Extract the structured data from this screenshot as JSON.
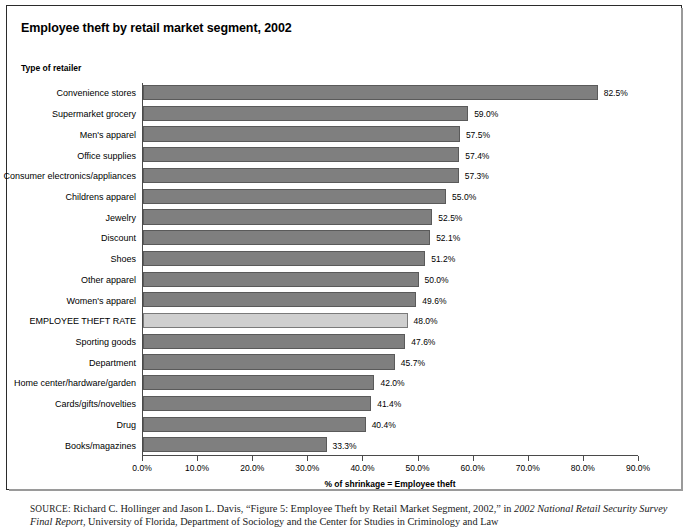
{
  "figure": {
    "title": "Employee theft by retail market segment, 2002",
    "category_axis_title": "Type of retailer",
    "value_axis_title": "% of shrinkage = Employee theft"
  },
  "source": {
    "kicker": "SOURCE:",
    "line1_a": " Richard C. Hollinger and Jason L. Davis, “Figure 5: Employee Theft by Retail Market Segment, 2002,” in ",
    "line1_italic": "2002 National Retail Security Survey",
    "line2_italic": "Final Report",
    "line2_b": ", University of Florida, Department of Sociology and the Center for Studies in Criminology and Law"
  },
  "colors": {
    "bar_fill": "#7f7f7f",
    "bar_stroke": "#5a5a5a",
    "highlight_fill": "#cfcfcf",
    "highlight_stroke": "#7a7a7a",
    "axis": "#4a4a4a",
    "frame": "#2b2b2b"
  },
  "chart_data": {
    "type": "bar",
    "orientation": "horizontal",
    "title": "Employee theft by retail market segment, 2002",
    "xlabel": "% of shrinkage = Employee theft",
    "ylabel": "Type of retailer",
    "xlim": [
      0,
      90
    ],
    "xticks": [
      0,
      10,
      20,
      30,
      40,
      50,
      60,
      70,
      80,
      90
    ],
    "xtick_labels": [
      "0.0%",
      "10.0%",
      "20.0%",
      "30.0%",
      "40.0%",
      "50.0%",
      "60.0%",
      "70.0%",
      "80.0%",
      "90.0%"
    ],
    "grid": false,
    "legend": false,
    "categories": [
      "Convenience stores",
      "Supermarket grocery",
      "Men's apparel",
      "Office supplies",
      "Consumer electronics/appliances",
      "Childrens apparel",
      "Jewelry",
      "Discount",
      "Shoes",
      "Other apparel",
      "Women's apparel",
      "EMPLOYEE THEFT RATE",
      "Sporting goods",
      "Department",
      "Home center/hardware/garden",
      "Cards/gifts/novelties",
      "Drug",
      "Books/magazines"
    ],
    "values": [
      82.5,
      59.0,
      57.5,
      57.4,
      57.3,
      55.0,
      52.5,
      52.1,
      51.2,
      50.0,
      49.6,
      48.0,
      47.6,
      45.7,
      42.0,
      41.4,
      40.4,
      33.3
    ],
    "value_labels": [
      "82.5%",
      "59.0%",
      "57.5%",
      "57.4%",
      "57.3%",
      "55.0%",
      "52.5%",
      "52.1%",
      "51.2%",
      "50.0%",
      "49.6%",
      "48.0%",
      "47.6%",
      "45.7%",
      "42.0%",
      "41.4%",
      "40.4%",
      "33.3%"
    ],
    "highlighted_index": 11
  }
}
